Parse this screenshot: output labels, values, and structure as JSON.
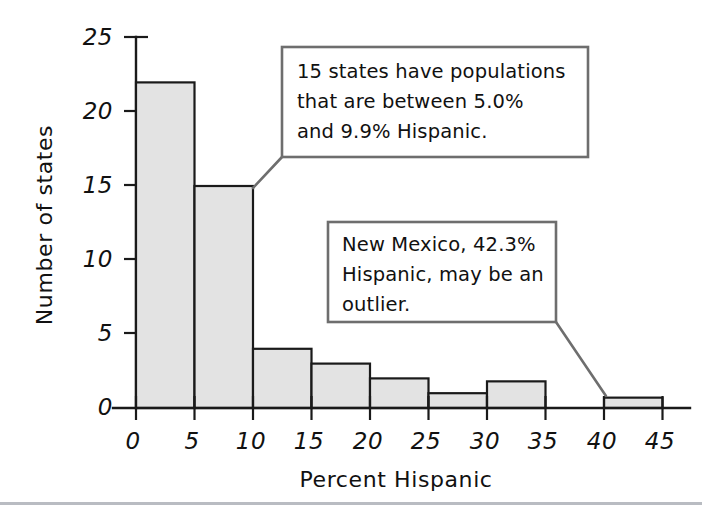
{
  "chart_data": {
    "type": "bar",
    "title": "",
    "subtitle": "",
    "xlabel": "Percent Hispanic",
    "ylabel": "Number of states",
    "xlim": [
      0,
      45
    ],
    "ylim": [
      0,
      25
    ],
    "grid": false,
    "legend": "none",
    "bin_width": 5,
    "x_ticks": [
      "0",
      "5",
      "10",
      "15",
      "20",
      "25",
      "30",
      "35",
      "40",
      "45"
    ],
    "x_tick_values": [
      0,
      5,
      10,
      15,
      20,
      25,
      30,
      35,
      40,
      45
    ],
    "y_ticks": [
      "0",
      "5",
      "10",
      "15",
      "20",
      "25"
    ],
    "y_tick_values": [
      0,
      5,
      10,
      15,
      20,
      25
    ],
    "categories": [
      "0-5",
      "5-10",
      "10-15",
      "15-20",
      "20-25",
      "25-30",
      "30-35",
      "35-40",
      "40-45"
    ],
    "bin_starts": [
      0,
      5,
      10,
      15,
      20,
      25,
      30,
      35,
      40
    ],
    "values": [
      22,
      15,
      4,
      3,
      2,
      1,
      1.8,
      0,
      0.7
    ],
    "bar_fill_color": "#e3e3e3",
    "bar_stroke_color": "#1a1a1a"
  },
  "annotations": [
    {
      "id": "callout-15-states",
      "lines": [
        "15 states have populations",
        "that are between 5.0%",
        "and 9.9% Hispanic."
      ],
      "points_to": "bin-5-10"
    },
    {
      "id": "callout-new-mexico",
      "lines": [
        "New Mexico, 42.3%",
        "Hispanic, may be an",
        "outlier."
      ],
      "points_to": "bin-40-45"
    }
  ],
  "colors": {
    "background": "#ffffff",
    "axis": "#1a1a1a",
    "callout_border": "#6e6e6e",
    "footer_rule": "#b9bcc2"
  }
}
